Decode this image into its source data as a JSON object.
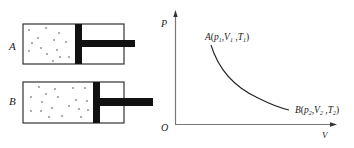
{
  "cylinders": [
    {
      "label": "A",
      "state": "compressed"
    },
    {
      "label": "B",
      "state": "expanded"
    }
  ],
  "graph": {
    "y_axis_label": "P",
    "x_axis_label": "V",
    "origin_label": "O",
    "point_a": {
      "name": "A",
      "p": "p",
      "p_sub": "1",
      "v": "V",
      "v_sub": "1",
      "t": "T",
      "t_sub": "1"
    },
    "point_b": {
      "name": "B",
      "p": "p",
      "p_sub": "2",
      "v": "V",
      "v_sub": "2",
      "t": "T",
      "t_sub": "2"
    }
  },
  "colors": {
    "stroke": "#333333",
    "fill": "#111111"
  }
}
